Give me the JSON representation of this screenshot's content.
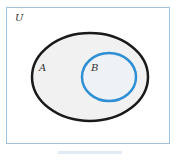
{
  "diagram": {
    "type": "venn",
    "universe_label": "U",
    "sets": [
      {
        "label": "A",
        "stroke": "#1a1a1a",
        "fill": "#f1f1f1"
      },
      {
        "label": "B",
        "stroke": "#2f8fd4",
        "fill": "#eef2f6"
      }
    ],
    "relation": "B is a subset of A"
  }
}
